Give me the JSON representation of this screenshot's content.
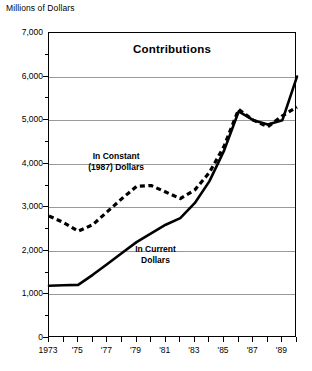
{
  "chart_data": {
    "type": "line",
    "title": "Contributions",
    "ylabel": "Millions of Dollars",
    "xlabel": "",
    "ylim": [
      0,
      7000
    ],
    "xlim": [
      1973,
      1990
    ],
    "grid": true,
    "legend_position": "inline-annotations",
    "ytick_labels": [
      "7,000",
      "6,000",
      "5,000",
      "4,000",
      "3,000",
      "2,000",
      "1,000",
      "0"
    ],
    "ytick_values": [
      7000,
      6000,
      5000,
      4000,
      3000,
      2000,
      1000,
      0
    ],
    "yminor_values": [
      6500,
      5500,
      4500,
      3500,
      2500,
      1500,
      500
    ],
    "xtick_values": [
      1973,
      1974,
      1975,
      1976,
      1977,
      1978,
      1979,
      1980,
      1981,
      1982,
      1983,
      1984,
      1985,
      1986,
      1987,
      1988,
      1989,
      1990
    ],
    "xtick_labels": [
      "1973",
      "",
      "'75",
      "",
      "'77",
      "",
      "'79",
      "",
      "'81",
      "",
      "'83",
      "",
      "'85",
      "",
      "'87",
      "",
      "'89",
      ""
    ],
    "x": [
      1973,
      1974,
      1975,
      1976,
      1977,
      1978,
      1979,
      1980,
      1981,
      1982,
      1983,
      1984,
      1985,
      1986,
      1987,
      1988,
      1989,
      1990
    ],
    "series": [
      {
        "name": "In Current Dollars",
        "style": "solid",
        "color": "#000000",
        "values": [
          1200,
          1210,
          1220,
          1450,
          1700,
          1950,
          2200,
          2400,
          2600,
          2750,
          3100,
          3600,
          4300,
          5200,
          5000,
          4900,
          5000,
          6000
        ]
      },
      {
        "name": "In Constant (1987) Dollars",
        "style": "dashed",
        "color": "#000000",
        "values": [
          2800,
          2650,
          2450,
          2600,
          2900,
          3200,
          3480,
          3500,
          3350,
          3200,
          3400,
          3800,
          4400,
          5250,
          5000,
          4850,
          5100,
          5300
        ]
      }
    ],
    "annotations": [
      {
        "text_line1": "In Constant",
        "text_line2": "(1987) Dollars",
        "x": 1977.6,
        "y": 4050
      },
      {
        "text_line1": "In Current",
        "text_line2": "Dollars",
        "x": 1980.3,
        "y": 1900
      }
    ]
  }
}
